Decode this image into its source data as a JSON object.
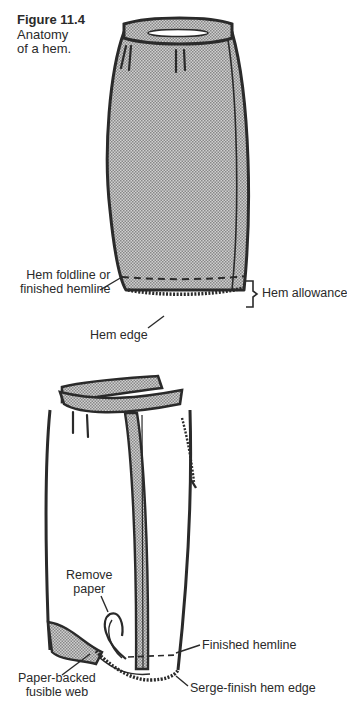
{
  "figure": {
    "number": "Figure 11.4",
    "title_line1": "Anatomy",
    "title_line2": "of a hem."
  },
  "top_diagram": {
    "labels": {
      "hem_foldline_1": "Hem foldline or",
      "hem_foldline_2": "finished hemline",
      "hem_allowance": "Hem allowance",
      "hem_edge": "Hem edge"
    }
  },
  "bottom_diagram": {
    "labels": {
      "remove_paper_1": "Remove",
      "remove_paper_2": "paper",
      "finished_hemline": "Finished hemline",
      "paper_backed_1": "Paper-backed",
      "paper_backed_2": "fusible web",
      "serge_finish": "Serge-finish hem edge"
    }
  },
  "colors": {
    "ink": "#2a2a2a",
    "fabric_fill": "#b8b8b8",
    "background": "#ffffff"
  }
}
